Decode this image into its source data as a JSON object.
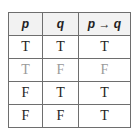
{
  "table": {
    "headers": [
      "p",
      "q",
      "p → q"
    ],
    "rows": [
      {
        "cells": [
          "T",
          "T",
          "T"
        ],
        "dimmed": false
      },
      {
        "cells": [
          "T",
          "F",
          "F"
        ],
        "dimmed": true
      },
      {
        "cells": [
          "F",
          "T",
          "T"
        ],
        "dimmed": false
      },
      {
        "cells": [
          "F",
          "F",
          "T"
        ],
        "dimmed": false
      }
    ]
  },
  "colors": {
    "border": "#6e6e6e",
    "header_bg": "#f2f2f2",
    "text": "#222222",
    "dimmed_text": "#9a9a9a"
  }
}
